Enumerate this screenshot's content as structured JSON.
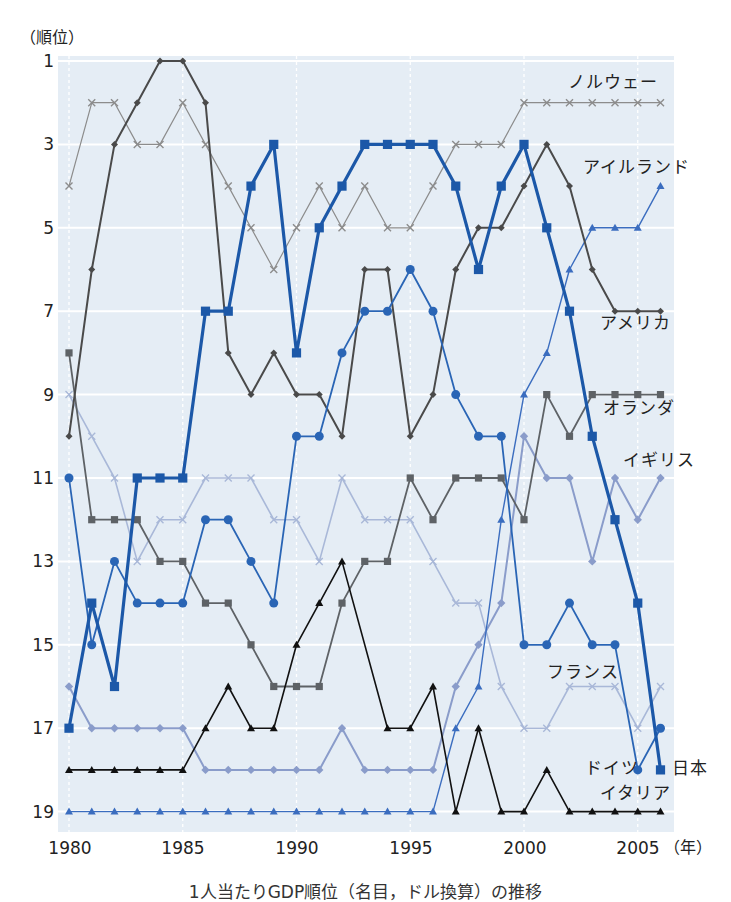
{
  "chart_data": {
    "type": "line",
    "title": "",
    "ylabel": "（順位）",
    "xlabel": "（年）",
    "x": [
      1980,
      1981,
      1982,
      1983,
      1984,
      1985,
      1986,
      1987,
      1988,
      1989,
      1990,
      1991,
      1992,
      1993,
      1994,
      1995,
      1996,
      1997,
      1998,
      1999,
      2000,
      2001,
      2002,
      2003,
      2004,
      2005,
      2006
    ],
    "xlim": [
      1980,
      2006
    ],
    "ylim": [
      1,
      19
    ],
    "y_inverted": true,
    "x_ticks": [
      1980,
      1985,
      1990,
      1995,
      2000,
      2005
    ],
    "y_ticks": [
      1,
      3,
      5,
      7,
      9,
      11,
      13,
      15,
      17,
      19
    ],
    "grid": true,
    "legend_position": "inline labels at right end of each line",
    "panel_color": "#e5edf5",
    "series": [
      {
        "name": "ノルウェー",
        "color": "#8c8c8c",
        "marker": "x",
        "line_width": 1.2,
        "marker_size": 3.5,
        "values": [
          4,
          2,
          2,
          3,
          3,
          2,
          3,
          4,
          5,
          6,
          5,
          4,
          5,
          4,
          5,
          5,
          4,
          3,
          3,
          3,
          2,
          2,
          2,
          2,
          2,
          2,
          2
        ]
      },
      {
        "name": "フランス",
        "color": "#a9b8d8",
        "marker": "x",
        "line_width": 1.6,
        "marker_size": 3.5,
        "values": [
          9,
          10,
          11,
          13,
          12,
          12,
          11,
          11,
          11,
          12,
          12,
          13,
          11,
          12,
          12,
          12,
          13,
          14,
          14,
          16,
          17,
          17,
          16,
          16,
          16,
          17,
          16
        ]
      },
      {
        "name": "イギリス",
        "color": "#8a9cca",
        "marker": "diamond",
        "line_width": 2.0,
        "marker_size": 4.2,
        "values": [
          16,
          17,
          17,
          17,
          17,
          17,
          18,
          18,
          18,
          18,
          18,
          18,
          17,
          18,
          18,
          18,
          18,
          16,
          15,
          14,
          10,
          11,
          11,
          13,
          11,
          12,
          11
        ]
      },
      {
        "name": "アイルランド",
        "color": "#3b6dbf",
        "marker": "triangle",
        "line_width": 1.4,
        "marker_size": 4,
        "values": [
          19,
          19,
          19,
          19,
          19,
          19,
          19,
          19,
          19,
          19,
          19,
          19,
          19,
          19,
          19,
          19,
          19,
          17,
          16,
          12,
          9,
          8,
          6,
          5,
          5,
          5,
          4
        ]
      },
      {
        "name": "オランダ",
        "color": "#5e6266",
        "marker": "square",
        "line_width": 1.8,
        "marker_size": 3.6,
        "values": [
          8,
          12,
          12,
          12,
          13,
          13,
          14,
          14,
          15,
          16,
          16,
          16,
          14,
          13,
          13,
          11,
          12,
          11,
          11,
          11,
          12,
          9,
          10,
          9,
          9,
          9,
          9
        ]
      },
      {
        "name": "アメリカ",
        "color": "#4a4a4a",
        "marker": "diamond",
        "line_width": 2.0,
        "marker_size": 3.5,
        "values": [
          10,
          6,
          3,
          2,
          1,
          1,
          2,
          8,
          9,
          8,
          9,
          9,
          10,
          6,
          6,
          10,
          9,
          6,
          5,
          5,
          4,
          3,
          4,
          6,
          7,
          7,
          7
        ]
      },
      {
        "name": "ドイツ",
        "color": "#2a65b5",
        "marker": "circle",
        "line_width": 1.8,
        "marker_size": 4.5,
        "values": [
          11,
          15,
          13,
          14,
          14,
          14,
          12,
          12,
          13,
          14,
          10,
          10,
          8,
          7,
          7,
          6,
          7,
          9,
          10,
          10,
          15,
          15,
          14,
          15,
          15,
          18,
          17
        ]
      },
      {
        "name": "イタリア",
        "color": "#111111",
        "marker": "triangle",
        "line_width": 1.6,
        "marker_size": 4,
        "values": [
          18,
          18,
          18,
          18,
          18,
          18,
          17,
          16,
          17,
          17,
          15,
          14,
          13,
          null,
          17,
          17,
          16,
          19,
          17,
          19,
          19,
          18,
          19,
          19,
          19,
          19,
          19
        ]
      },
      {
        "name": "日本",
        "color": "#1c58a8",
        "marker": "square",
        "line_width": 3.2,
        "marker_size": 4.6,
        "values": [
          17,
          14,
          16,
          11,
          11,
          11,
          7,
          7,
          4,
          3,
          8,
          5,
          4,
          3,
          3,
          3,
          3,
          4,
          6,
          4,
          3,
          5,
          7,
          10,
          12,
          14,
          18
        ]
      }
    ],
    "caption": "1人当たりGDP順位（名目，ドル換算）の推移"
  }
}
